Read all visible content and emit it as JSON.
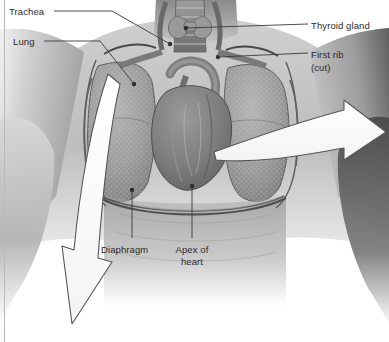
{
  "figure": {
    "orientation": "anterior view of chest with thoracic wall removed",
    "style": "grayscale medical illustration",
    "width": 389,
    "height": 342
  },
  "colors": {
    "background": "#ffffff",
    "label_text": "#2b2b2b",
    "leader_line": "#3a3a3a",
    "arrow_fill": "#ffffff",
    "arrow_outline": "#555555",
    "edge_rule": "#b9b9b9",
    "tissue_dark": "#3d3d3d",
    "tissue_mid": "#8f8f8f",
    "tissue_light": "#d4d4d4"
  },
  "labels": [
    {
      "id": "trachea",
      "text": "Trachea",
      "x": 9,
      "y": 6,
      "leader": "elbow-right-down",
      "target": "trachea in neck"
    },
    {
      "id": "lung",
      "text": "Lung",
      "x": 13,
      "y": 36,
      "leader": "elbow-right-down",
      "target": "right lung field"
    },
    {
      "id": "thyroid-gland",
      "text": "Thyroid gland",
      "x": 311,
      "y": 20,
      "leader": "horizontal-left",
      "target": "thyroid gland"
    },
    {
      "id": "first-rib",
      "text": "First rib",
      "x": 311,
      "y": 49,
      "leader": "horizontal-left",
      "target": "first rib"
    },
    {
      "id": "first-rib-cut",
      "text": "(cut)",
      "x": 311,
      "y": 62,
      "leader": "none",
      "target": ""
    },
    {
      "id": "diaphragm",
      "text": "Diaphragm",
      "x": 101,
      "y": 244,
      "leader": "vertical-up",
      "target": "diaphragm dome"
    },
    {
      "id": "apex-line1",
      "text": "Apex of",
      "x": 176,
      "y": 244,
      "leader": "vertical-up",
      "target": "apex of heart"
    },
    {
      "id": "apex-line2",
      "text": "heart",
      "x": 176,
      "y": 256,
      "leader": "none",
      "target": ""
    }
  ],
  "arrows": [
    {
      "id": "lateral-expansion-arrow",
      "direction": "right",
      "description": "large white curved arrow sweeping laterally to the right"
    },
    {
      "id": "diaphragm-descent-arrow",
      "direction": "down",
      "description": "large white curved arrow sweeping downward to the lower left"
    }
  ],
  "structures": [
    "trachea",
    "thyroid gland",
    "first rib (cut)",
    "right lung",
    "left lung",
    "heart",
    "aortic arch",
    "pulmonary vessels",
    "diaphragm",
    "apex of heart",
    "ribs"
  ]
}
